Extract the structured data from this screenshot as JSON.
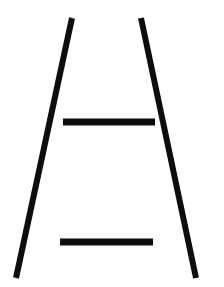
{
  "canvas": {
    "width": 224,
    "height": 287,
    "background_color": "#ffffff",
    "ink_color": "#0d0d0d",
    "title": "Letter A line drawing"
  },
  "figure": {
    "name": "letter-a-figure",
    "stroke_color": "#0d0d0d",
    "strokes": [
      {
        "id": "left-diagonal",
        "name": "left-diagonal-stroke",
        "type": "line",
        "x1": 72,
        "y1": 18,
        "x2": 16,
        "y2": 278,
        "width": 6
      },
      {
        "id": "right-diagonal",
        "name": "right-diagonal-stroke",
        "type": "line",
        "x1": 141,
        "y1": 18,
        "x2": 196,
        "y2": 278,
        "width": 6
      },
      {
        "id": "upper-crossbar",
        "name": "upper-crossbar-stroke",
        "type": "line",
        "x1": 63,
        "y1": 122,
        "x2": 155,
        "y2": 122,
        "width": 7
      },
      {
        "id": "lower-crossbar",
        "name": "lower-crossbar-stroke",
        "type": "line",
        "x1": 60,
        "y1": 242,
        "x2": 153,
        "y2": 242,
        "width": 7
      }
    ]
  }
}
